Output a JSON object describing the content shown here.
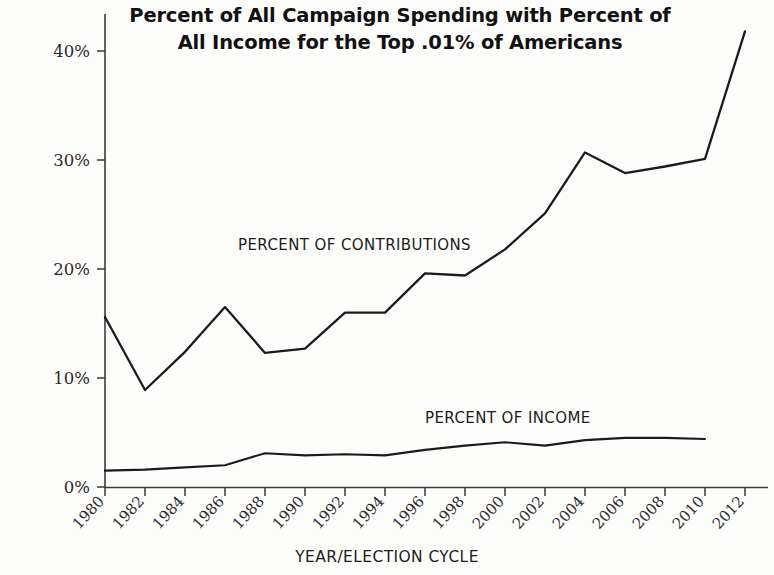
{
  "chart_data": {
    "type": "line",
    "title": "Percent of All Campaign Spending with Percent of All Income for the Top .01% of Americans",
    "title_lines": [
      "Percent of All Campaign Spending with Percent of",
      "All Income for the Top .01% of Americans"
    ],
    "xlabel": "YEAR/ELECTION CYCLE",
    "ylabel": "",
    "x": [
      1980,
      1982,
      1984,
      1986,
      1988,
      1990,
      1992,
      1994,
      1996,
      1998,
      2000,
      2002,
      2004,
      2006,
      2008,
      2010,
      2012
    ],
    "xtick_labels": [
      "1980",
      "1982",
      "1984",
      "1986",
      "1988",
      "1990",
      "1992",
      "1994",
      "1996",
      "1998",
      "2000",
      "2002",
      "2004",
      "2006",
      "2008",
      "2010",
      "2012"
    ],
    "ytick_labels": [
      "0%",
      "10%",
      "20%",
      "30%",
      "40%"
    ],
    "ytick_values": [
      0,
      10,
      20,
      30,
      40
    ],
    "ylim": [
      0,
      43
    ],
    "xlim": [
      1979,
      2013
    ],
    "grid": false,
    "legend_position": "inline-annotations",
    "series": [
      {
        "name": "PERCENT OF CONTRIBUTIONS",
        "values": [
          15.6,
          8.9,
          12.4,
          16.5,
          12.3,
          12.7,
          16.0,
          16.0,
          19.6,
          19.4,
          21.8,
          25.1,
          30.7,
          28.8,
          29.4,
          30.1,
          41.8
        ]
      },
      {
        "name": "PERCENT OF INCOME",
        "values": [
          1.5,
          1.6,
          1.8,
          2.0,
          3.1,
          2.9,
          3.0,
          2.9,
          3.4,
          3.8,
          4.1,
          3.8,
          4.3,
          4.5,
          4.5,
          4.4,
          null
        ]
      }
    ],
    "annotations": [
      {
        "text": "PERCENT OF CONTRIBUTIONS",
        "x": 1984.5,
        "y": 22.5
      },
      {
        "text": "PERCENT OF INCOME",
        "x": 1999.0,
        "y": 7.2
      }
    ],
    "colors": {
      "line": "#1b1b1b",
      "axis": "#3a3a3a",
      "background": "#fdfdfb",
      "text": "#111111"
    }
  },
  "axis": {
    "x_title": "YEAR/ELECTION CYCLE"
  },
  "footer": {
    "source_note": ""
  }
}
